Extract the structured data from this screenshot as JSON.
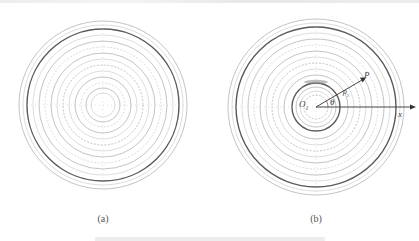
{
  "figure": {
    "panels": [
      {
        "id": "a",
        "caption": "(a)",
        "center": [
          103,
          105
        ],
        "rings": [
          84,
          80,
          76,
          70,
          64,
          58,
          52,
          46,
          40,
          34,
          28,
          22,
          17,
          12
        ],
        "heavy_rings": [
          76
        ]
      },
      {
        "id": "b",
        "caption": "(b)",
        "center": [
          316,
          107
        ],
        "rings": [
          88,
          84,
          80,
          74,
          68,
          62,
          56,
          50,
          44,
          38,
          32,
          24,
          20,
          16,
          12
        ],
        "heavy_rings": [
          80,
          24
        ],
        "labels": {
          "origin": "O",
          "origin_sub": "1",
          "point": "P",
          "angle": "θ",
          "radius": "ρ",
          "radius_sub": "1",
          "axis": "x"
        }
      }
    ],
    "colors": {
      "ring": "#9a9a9a",
      "ring_light": "#c4c4c4",
      "heavy": "#5a5a5a",
      "axis": "#333333"
    }
  }
}
